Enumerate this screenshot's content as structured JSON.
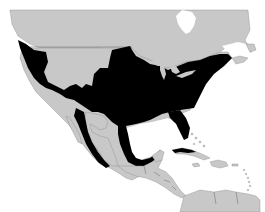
{
  "map": {
    "type": "range-map",
    "region": "North America, Central America and Caribbean",
    "colors": {
      "background_water": "#ffffff",
      "land_outside_range": "#c8c8c8",
      "range": "#000000",
      "borders": "#777777"
    },
    "layers": [
      {
        "name": "land",
        "description": "Land outside the range shown in light gray"
      },
      {
        "name": "range",
        "description": "Distribution range shown in black covering most of the contiguous United States, southern Canada border regions, Pacific coast of Mexico and eastern Mexican Gulf coast, and western Cuba"
      }
    ]
  }
}
